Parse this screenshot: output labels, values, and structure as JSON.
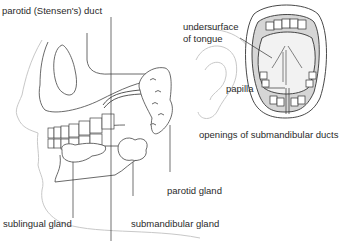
{
  "diagram": {
    "views": [
      "lateral head (left)",
      "open mouth front view (right)"
    ],
    "labels": {
      "parotid_duct": "parotid (Stensen's) duct",
      "undersurface_line1": "undersurface",
      "undersurface_line2": "of tongue",
      "papilla": "papilla",
      "openings": "openings of submandibular ducts",
      "parotid_gland": "parotid gland",
      "sublingual_gland": "sublingual gland",
      "submandibular_gland": "submandibular gland"
    },
    "colors": {
      "line": "#333333",
      "faint": "#c8c8c8",
      "text": "#2a2a2a",
      "shade": "#d6d6d6"
    }
  }
}
